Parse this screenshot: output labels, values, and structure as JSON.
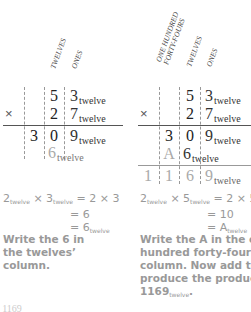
{
  "left_panel": {
    "headers": [
      "TWELVES",
      "ONES"
    ],
    "multiplicand": {
      "digits": [
        "5",
        "3"
      ],
      "subscript": "twelve"
    },
    "multiplier": {
      "sign": "×",
      "digits": [
        "2",
        "7"
      ],
      "subscript": "twelve"
    },
    "partial1": {
      "digits": [
        "3",
        "0",
        "9"
      ],
      "subscript": "twelve"
    },
    "partial2": {
      "digits": [
        "6"
      ],
      "subscript": "twelve"
    },
    "equation": {
      "line1_a": "2",
      "line1_a_sub": "twelve",
      "line1_op": "×",
      "line1_b": "3",
      "line1_b_sub": "twelve",
      "line1_rhs": "= 2 × 3",
      "line2": "= 6",
      "line3": "= 6",
      "line3_sub": "twelve"
    },
    "instruction": "Write the 6 in the twelves’ column."
  },
  "right_panel": {
    "headers": [
      "ONE HUNDRED",
      "FORTY-FOURS",
      "TWELVES",
      "ONES"
    ],
    "multiplicand": {
      "digits": [
        "5",
        "3"
      ],
      "subscript": "twelve"
    },
    "multiplier": {
      "sign": "×",
      "digits": [
        "2",
        "7"
      ],
      "subscript": "twelve"
    },
    "partial1": {
      "digits": [
        "3",
        "0",
        "9"
      ],
      "subscript": "twelve"
    },
    "partial2": {
      "digits": [
        "A",
        "6"
      ],
      "subscript": "twelve"
    },
    "product": {
      "digits": [
        "1",
        "1",
        "6",
        "9"
      ],
      "subscript": "twelve"
    },
    "equation": {
      "line1_a": "2",
      "line1_a_sub": "twelve",
      "line1_op": "×",
      "line1_b": "5",
      "line1_b_sub": "twelve",
      "line1_rhs": "= 2 × 5",
      "line2": "= 10",
      "line3": "= A",
      "line3_sub": "twelve"
    },
    "instruction_parts": [
      "Write the A in the one",
      "hundred forty-fours’",
      "column. Now add to",
      "produce the product",
      "1169"
    ],
    "instruction_sub": "twelve",
    "instruction_end": "."
  },
  "footer": {
    "fragment": "= 1169"
  }
}
